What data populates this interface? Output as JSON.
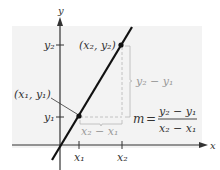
{
  "diagram": {
    "type": "slope-of-line",
    "axes": {
      "x_label": "x",
      "y_label": "y",
      "x_ticks": [
        "x₁",
        "x₂"
      ],
      "y_ticks": [
        "y₁",
        "y₂"
      ]
    },
    "points": [
      {
        "name": "point-1",
        "label": "(x₁, y₁)"
      },
      {
        "name": "point-2",
        "label": "(x₂, y₂)"
      }
    ],
    "rise_label": "y₂ − y₁",
    "run_label": "x₂ − x₁",
    "formula": {
      "lhs": "m",
      "equals": "=",
      "numerator": "y₂ − y₁",
      "denominator": "x₂ − x₁"
    },
    "colors": {
      "panel": "#f4f4f4",
      "line": "#111111",
      "guides": "#b5b5b5",
      "axes": "#333333"
    }
  }
}
